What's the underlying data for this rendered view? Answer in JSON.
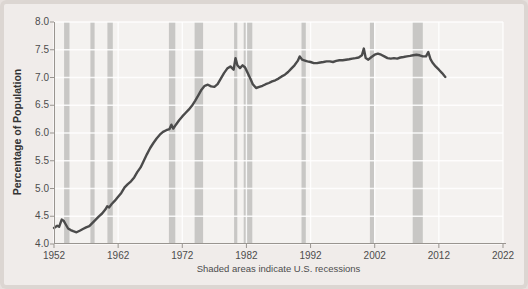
{
  "chart_data": {
    "type": "line",
    "title": "",
    "ylabel": "Percentage of Population",
    "caption": "Shaded areas indicate U.S. recessions",
    "xlim": [
      1952,
      2022
    ],
    "ylim": [
      4.0,
      8.0
    ],
    "grid": "white lines on light plot background",
    "legend": "none",
    "ytick_values": [
      8.0,
      7.5,
      7.0,
      6.5,
      6.0,
      5.5,
      5.0,
      4.5,
      4.0
    ],
    "ytick_labels": [
      "8.0",
      "7.5",
      "7.0",
      "6.5",
      "6.0",
      "5.5",
      "5.0",
      "4.5",
      "4.0"
    ],
    "xtick_values": [
      1952,
      1962,
      1972,
      1982,
      1992,
      2002,
      2012,
      2022
    ],
    "xtick_labels": [
      "1952",
      "1962",
      "1972",
      "1982",
      "1992",
      "2002",
      "2012",
      "2022"
    ],
    "recessions": [
      [
        1953.58,
        1954.42
      ],
      [
        1957.67,
        1958.33
      ],
      [
        1960.33,
        1961.17
      ],
      [
        1969.92,
        1970.92
      ],
      [
        1973.92,
        1975.25
      ],
      [
        1980.08,
        1980.58
      ],
      [
        1981.58,
        1982.92
      ],
      [
        1990.58,
        1991.25
      ],
      [
        2001.25,
        2001.92
      ],
      [
        2007.92,
        2009.5
      ]
    ],
    "series": {
      "x": [
        1952.0,
        1952.5,
        1952.8,
        1953.2,
        1953.5,
        1953.8,
        1954.2,
        1954.6,
        1955.0,
        1955.5,
        1956.0,
        1956.5,
        1957.0,
        1957.5,
        1958.0,
        1958.5,
        1959.0,
        1959.5,
        1960.0,
        1960.3,
        1960.6,
        1961.0,
        1961.5,
        1962.0,
        1962.5,
        1963.0,
        1963.5,
        1964.0,
        1964.5,
        1965.0,
        1965.5,
        1966.0,
        1966.5,
        1967.0,
        1967.5,
        1968.0,
        1968.5,
        1969.0,
        1969.5,
        1970.0,
        1970.3,
        1970.6,
        1971.0,
        1971.5,
        1972.0,
        1972.5,
        1973.0,
        1973.5,
        1974.0,
        1974.5,
        1975.0,
        1975.5,
        1976.0,
        1976.5,
        1977.0,
        1977.5,
        1978.0,
        1978.5,
        1979.0,
        1979.5,
        1980.0,
        1980.3,
        1980.6,
        1981.0,
        1981.4,
        1981.8,
        1982.2,
        1982.6,
        1983.0,
        1983.5,
        1984.0,
        1984.5,
        1985.0,
        1985.5,
        1986.0,
        1986.5,
        1987.0,
        1987.5,
        1988.0,
        1988.5,
        1989.0,
        1989.5,
        1990.0,
        1990.3,
        1990.7,
        1991.0,
        1991.5,
        1992.0,
        1992.5,
        1993.0,
        1993.5,
        1994.0,
        1994.5,
        1995.0,
        1995.5,
        1996.0,
        1996.5,
        1997.0,
        1997.5,
        1998.0,
        1998.5,
        1999.0,
        1999.5,
        2000.0,
        2000.3,
        2000.6,
        2001.0,
        2001.5,
        2002.0,
        2002.5,
        2003.0,
        2003.5,
        2004.0,
        2004.5,
        2005.0,
        2005.5,
        2006.0,
        2006.5,
        2007.0,
        2007.5,
        2008.0,
        2008.5,
        2009.0,
        2009.5,
        2010.0,
        2010.35,
        2010.7,
        2011.0,
        2011.5,
        2012.0,
        2012.5,
        2013.0
      ],
      "y": [
        4.29,
        4.33,
        4.31,
        4.44,
        4.42,
        4.36,
        4.28,
        4.25,
        4.23,
        4.21,
        4.24,
        4.27,
        4.3,
        4.32,
        4.38,
        4.44,
        4.5,
        4.55,
        4.62,
        4.68,
        4.66,
        4.72,
        4.78,
        4.85,
        4.92,
        5.02,
        5.08,
        5.13,
        5.2,
        5.3,
        5.38,
        5.5,
        5.62,
        5.73,
        5.82,
        5.9,
        5.97,
        6.02,
        6.05,
        6.07,
        6.15,
        6.08,
        6.15,
        6.23,
        6.3,
        6.36,
        6.42,
        6.49,
        6.58,
        6.68,
        6.78,
        6.85,
        6.87,
        6.84,
        6.83,
        6.88,
        6.98,
        7.08,
        7.16,
        7.2,
        7.14,
        7.35,
        7.22,
        7.17,
        7.22,
        7.18,
        7.08,
        6.98,
        6.88,
        6.81,
        6.83,
        6.85,
        6.88,
        6.9,
        6.93,
        6.95,
        6.98,
        7.02,
        7.05,
        7.1,
        7.16,
        7.22,
        7.3,
        7.38,
        7.32,
        7.31,
        7.29,
        7.28,
        7.26,
        7.26,
        7.27,
        7.28,
        7.29,
        7.29,
        7.28,
        7.3,
        7.31,
        7.31,
        7.32,
        7.33,
        7.34,
        7.35,
        7.36,
        7.4,
        7.52,
        7.35,
        7.32,
        7.37,
        7.41,
        7.43,
        7.41,
        7.38,
        7.35,
        7.34,
        7.35,
        7.34,
        7.36,
        7.37,
        7.38,
        7.39,
        7.4,
        7.41,
        7.4,
        7.38,
        7.38,
        7.46,
        7.33,
        7.27,
        7.2,
        7.14,
        7.08,
        7.01
      ]
    },
    "colors": {
      "line": "#4b4b4b",
      "recession_band": "#c8c7c5",
      "gridline": "rgba(255,255,255,0.85)",
      "axis": "#999590",
      "plot_background": "#f4f2f0",
      "margin_background": "#f0ecea",
      "frame_edge": "#dcd6d2"
    }
  }
}
